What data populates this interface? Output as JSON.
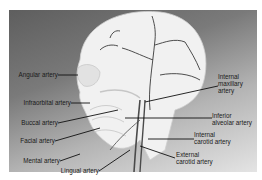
{
  "figure": {
    "colors": {
      "background_dark": "#5e5e5e",
      "background_light": "#e4e4e4",
      "skull": "#f2f2f2",
      "vessel": "#3a3a3a",
      "leader_line": "#111111",
      "text": "#1a1a1a"
    }
  },
  "labels": {
    "left": [
      {
        "text": "Angular artery"
      },
      {
        "text": "Infraorbital artery"
      },
      {
        "text": "Buccal artery"
      },
      {
        "text": "Facial artery"
      },
      {
        "text": "Mental artery"
      },
      {
        "text": "Lingual artery"
      }
    ],
    "right": [
      {
        "line1": "Internal",
        "line2": "maxillary",
        "line3": "artery"
      },
      {
        "line1": "Inferior",
        "line2": "alveolar artery"
      },
      {
        "line1": "Internal",
        "line2": "carotid artery"
      },
      {
        "line1": "External",
        "line2": "carotid artery"
      }
    ]
  }
}
